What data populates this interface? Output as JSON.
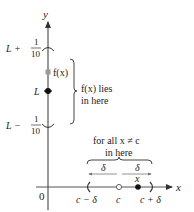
{
  "axes": {
    "y_label": "y",
    "x_label": "x",
    "origin_label": "0"
  },
  "y_ticks": {
    "upper": {
      "prefix": "L + ",
      "num": "1",
      "den": "10"
    },
    "middle": "L",
    "lower": {
      "prefix": "L − ",
      "num": "1",
      "den": "10"
    }
  },
  "point_fx_label": "f(x)",
  "y_bracket_label": {
    "line1": "f(x) lies",
    "line2": "in here"
  },
  "x_brace_label": {
    "line1": "for all x ≠ c",
    "line2": "in here"
  },
  "delta_left": "δ",
  "delta_right": "δ",
  "x_point_label": "x",
  "x_ticks": {
    "left": "c − δ",
    "center": "c",
    "right": "c + δ"
  },
  "colors": {
    "axis": "#444444",
    "point_fx": "#9a9a9a",
    "point_L": "#111111",
    "text": "#222222"
  }
}
